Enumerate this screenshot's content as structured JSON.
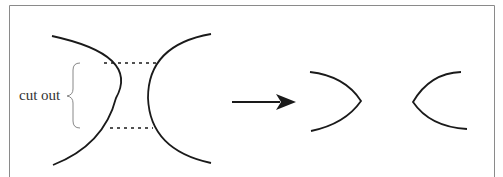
{
  "diagram": {
    "annotation": "cut out",
    "colors": {
      "stroke": "#1a1a1a",
      "frame": "#8a8a8a",
      "brace": "#888888",
      "background": "#ffffff"
    },
    "elements": [
      {
        "id": "left-arc",
        "type": "arc",
        "description": "concave-right arc (left lens edge)"
      },
      {
        "id": "right-arc",
        "type": "arc",
        "description": "concave-left arc (right lens edge)"
      },
      {
        "id": "dashed-top",
        "type": "dashed-line",
        "description": "upper cut line"
      },
      {
        "id": "dashed-bottom",
        "type": "dashed-line",
        "description": "lower cut line"
      },
      {
        "id": "brace",
        "type": "curly-brace",
        "description": "brace marking cut-out region"
      },
      {
        "id": "arrow",
        "type": "arrow",
        "description": "transformation arrow pointing right"
      },
      {
        "id": "result-left",
        "type": "pointed-arc",
        "description": "resulting right-pointing shape"
      },
      {
        "id": "result-right",
        "type": "pointed-arc",
        "description": "resulting left-pointing shape"
      }
    ]
  }
}
